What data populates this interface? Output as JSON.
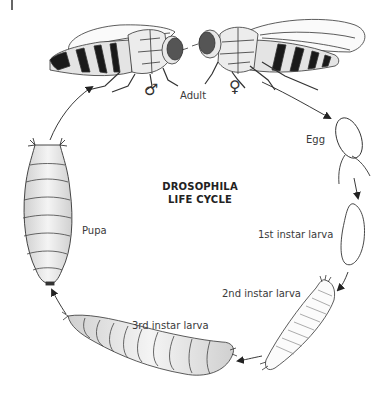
{
  "title": {
    "line1": "DROSOPHILA",
    "line2": "LIFE CYCLE"
  },
  "stages": [
    {
      "id": "adult",
      "label": "Adult"
    },
    {
      "id": "egg",
      "label": "Egg"
    },
    {
      "id": "larva1",
      "label": "1st instar larva"
    },
    {
      "id": "larva2",
      "label": "2nd instar larva"
    },
    {
      "id": "larva3",
      "label": "3rd instar larva"
    },
    {
      "id": "pupa",
      "label": "Pupa"
    }
  ],
  "adult_symbols": {
    "male": "♂",
    "female": "♀"
  },
  "colors": {
    "line": "#333333",
    "body_fill": "#e6e6e6",
    "eye_fill": "#555555",
    "band_fill": "#1a1a1a"
  }
}
